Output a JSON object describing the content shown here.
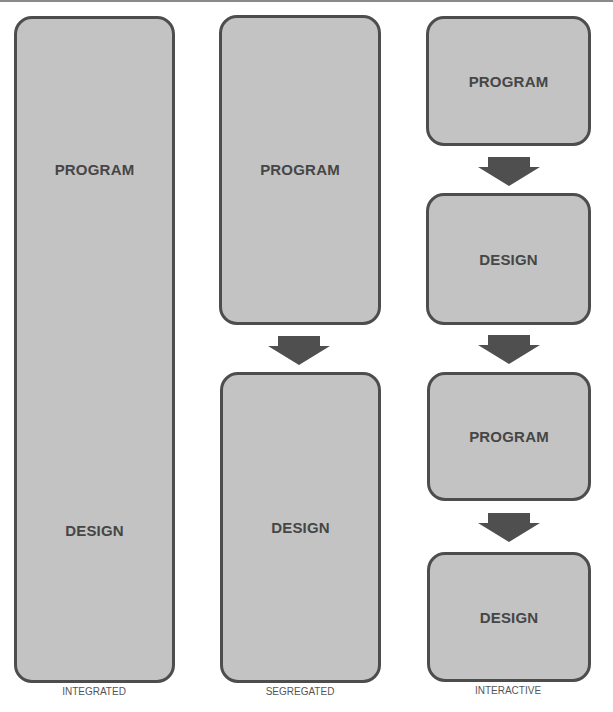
{
  "colors": {
    "box_fill": "#c3c3c3",
    "box_border": "#4d4d4d",
    "text": "#464646",
    "arrow": "#4f4f4f"
  },
  "columns": [
    {
      "caption": "INTEGRATED",
      "box": {
        "top_label": "PROGRAM",
        "bottom_label": "DESIGN"
      }
    },
    {
      "caption": "SEGREGATED",
      "boxes": [
        {
          "label": "PROGRAM"
        },
        {
          "label": "DESIGN"
        }
      ],
      "arrows": 1
    },
    {
      "caption": "INTERACTIVE",
      "boxes": [
        {
          "label": "PROGRAM"
        },
        {
          "label": "DESIGN"
        },
        {
          "label": "PROGRAM"
        },
        {
          "label": "DESIGN"
        }
      ],
      "arrows": 3
    }
  ]
}
